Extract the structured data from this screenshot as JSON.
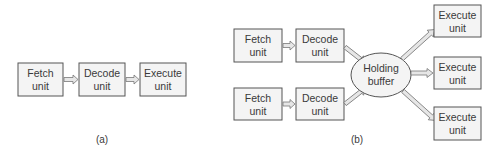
{
  "diagram_a": {
    "caption": "(a)",
    "units": [
      {
        "line1": "Fetch",
        "line2": "unit"
      },
      {
        "line1": "Decode",
        "line2": "unit"
      },
      {
        "line1": "Execute",
        "line2": "unit"
      }
    ]
  },
  "diagram_b": {
    "caption": "(b)",
    "pipelines": [
      {
        "fetch": {
          "line1": "Fetch",
          "line2": "unit"
        },
        "decode": {
          "line1": "Decode",
          "line2": "unit"
        }
      },
      {
        "fetch": {
          "line1": "Fetch",
          "line2": "unit"
        },
        "decode": {
          "line1": "Decode",
          "line2": "unit"
        }
      }
    ],
    "buffer": {
      "line1": "Holding",
      "line2": "buffer"
    },
    "execute_units": [
      {
        "line1": "Execute",
        "line2": "unit"
      },
      {
        "line1": "Execute",
        "line2": "unit"
      },
      {
        "line1": "Execute",
        "line2": "unit"
      }
    ]
  },
  "colors": {
    "box_fill": "#f4f4f4",
    "box_stroke": "#555555",
    "arrow_fill": "#e6e6e6",
    "text": "#3a3a3a"
  }
}
